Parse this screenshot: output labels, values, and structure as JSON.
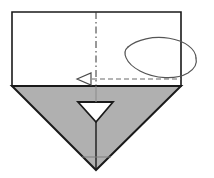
{
  "figure": {
    "kind": "origami-fold-diagram",
    "title": "",
    "caption": "",
    "background_color": "#ffffff",
    "stroke_color": "#1a1a1a",
    "shaded_fill": "#b0b0b0",
    "paper_fill": "#ffffff",
    "arrow_color": "#555555",
    "crease_color": "#333333",
    "width": 214,
    "height": 178
  },
  "shapes": {
    "paper_rectangle": {
      "name": "upper-square-panel",
      "points": "12,12 181,12 181,86 12,86",
      "fill": "#ffffff",
      "stroke": "#1a1a1a",
      "stroke_width": 1.6
    },
    "shaded_triangle": {
      "name": "lower-shaded-triangle",
      "points": "12,86 181,86 96,170",
      "fill": "#b0b0b0",
      "stroke": "#1a1a1a",
      "stroke_width": 2.0
    },
    "white_notch": {
      "name": "inner-white-v-notch",
      "points": "78,102 113,102 96,122",
      "fill": "#ffffff",
      "stroke": "#1a1a1a",
      "stroke_width": 1.8
    },
    "center_vertical_crease": {
      "name": "center-vertical-valley-crease",
      "x": 96,
      "y1": 12,
      "y2": 86,
      "style": "dash-dot",
      "stroke": "#333333",
      "stroke_width": 1.0,
      "dash_pattern": "7,3,1.5,3"
    },
    "lower_center_line": {
      "name": "lower-center-solid-line",
      "x": 96,
      "y1": 122,
      "y2": 170,
      "stroke": "#1a1a1a",
      "stroke_width": 1.4
    },
    "notch_apex_line": {
      "name": "notch-apex-connector",
      "x": 96,
      "y1": 86,
      "y2": 102,
      "stroke": "#8a8a8a",
      "stroke_width": 1.0
    },
    "bottom_fold_hint": {
      "name": "bottom-horizontal-fold-hint",
      "x1": 82,
      "x2": 111,
      "y": 157,
      "stroke": "#7e7e7e",
      "stroke_width": 1.0
    }
  },
  "annotations": {
    "rotation_arrow": {
      "name": "fold-behind-rotation-arrow",
      "description": "elliptical loop wrapping around the right edge indicating fold around to the back",
      "ellipse_center_x": 159,
      "ellipse_center_y": 58,
      "ellipse_rx": 37,
      "ellipse_ry": 21,
      "stroke": "#555555",
      "stroke_width": 1.2
    },
    "dashed_tail": {
      "name": "hidden-edge-dashed-line",
      "x1": 92,
      "x2": 181,
      "y": 79,
      "stroke": "#6a6a6a",
      "stroke_width": 1.1,
      "dash_pattern": "5,3"
    },
    "arrow_head": {
      "name": "fold-direction-arrowhead",
      "points": "77,79 91,73 91,85",
      "fill": "#ffffff",
      "stroke": "#4a4a4a",
      "stroke_width": 1.2,
      "direction": "left"
    }
  },
  "labels": {
    "step_number": "",
    "note": ""
  }
}
